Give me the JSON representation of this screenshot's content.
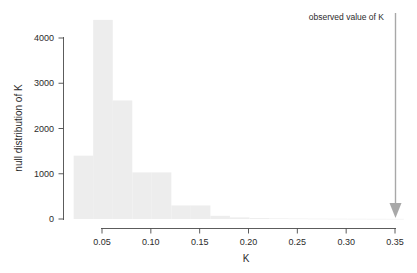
{
  "chart_data": {
    "type": "bar",
    "title": "",
    "subtitle": "",
    "xlabel": "K",
    "ylabel": "null distribution of K",
    "xlim": [
      0.0205,
      0.3595
    ],
    "ylim": [
      0,
      4450
    ],
    "xticks": [
      0.05,
      0.1,
      0.15,
      0.2,
      0.25,
      0.3,
      0.35
    ],
    "xtick_labels": [
      "0.05",
      "0.10",
      "0.15",
      "0.20",
      "0.25",
      "0.30",
      "0.35"
    ],
    "yticks": [
      0,
      1000,
      2000,
      3000,
      4000
    ],
    "ytick_labels": [
      "0",
      "1000",
      "2000",
      "3000",
      "4000"
    ],
    "grid": false,
    "legend": null,
    "bin_width": 0.02,
    "bins": [
      {
        "x0": 0.021,
        "x1": 0.041,
        "value": 1400
      },
      {
        "x0": 0.041,
        "x1": 0.061,
        "value": 4400
      },
      {
        "x0": 0.061,
        "x1": 0.081,
        "value": 2620
      },
      {
        "x0": 0.081,
        "x1": 0.101,
        "value": 1030
      },
      {
        "x0": 0.101,
        "x1": 0.121,
        "value": 1030
      },
      {
        "x0": 0.121,
        "x1": 0.141,
        "value": 300
      },
      {
        "x0": 0.141,
        "x1": 0.161,
        "value": 300
      },
      {
        "x0": 0.161,
        "x1": 0.181,
        "value": 70
      },
      {
        "x0": 0.181,
        "x1": 0.201,
        "value": 35
      },
      {
        "x0": 0.201,
        "x1": 0.221,
        "value": 20
      },
      {
        "x0": 0.221,
        "x1": 0.241,
        "value": 14
      },
      {
        "x0": 0.241,
        "x1": 0.261,
        "value": 10
      },
      {
        "x0": 0.261,
        "x1": 0.281,
        "value": 8
      },
      {
        "x0": 0.281,
        "x1": 0.301,
        "value": 6
      },
      {
        "x0": 0.301,
        "x1": 0.321,
        "value": 5
      },
      {
        "x0": 0.321,
        "x1": 0.341,
        "value": 4
      },
      {
        "x0": 0.341,
        "x1": 0.359,
        "value": 3
      }
    ],
    "categories": [
      "0.021-0.041",
      "0.041-0.061",
      "0.061-0.081",
      "0.081-0.101",
      "0.101-0.121",
      "0.121-0.141",
      "0.141-0.161",
      "0.161-0.181",
      "0.181-0.201",
      "0.201-0.221",
      "0.221-0.241",
      "0.241-0.261",
      "0.261-0.281",
      "0.281-0.301",
      "0.301-0.321",
      "0.321-0.341",
      "0.341-0.359"
    ],
    "values": [
      1400,
      4400,
      2620,
      1030,
      1030,
      300,
      300,
      70,
      35,
      20,
      14,
      10,
      8,
      6,
      5,
      4,
      3
    ],
    "annotations": [
      {
        "name": "observed-value-marker",
        "label": "observed value of K",
        "x": 0.35,
        "y_top": 4450,
        "y_bottom": 0,
        "style": "down-arrow"
      }
    ],
    "colors": {
      "bar_fill": "#ededed",
      "axis": "#4a4a4a",
      "text": "#2b2b2b",
      "annotation_arrow": "#a8a8a8",
      "background": "#ffffff"
    }
  },
  "labels": {
    "x_axis_title": "K",
    "y_axis_title": "null distribution of K",
    "observed_annotation": "observed value of K",
    "xticks": [
      "0.05",
      "0.10",
      "0.15",
      "0.20",
      "0.25",
      "0.30",
      "0.35"
    ],
    "yticks": [
      "4000",
      "3000",
      "2000",
      "1000",
      "0"
    ]
  }
}
